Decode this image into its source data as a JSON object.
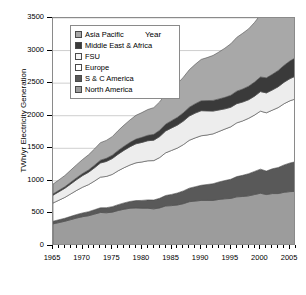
{
  "chart_data": {
    "type": "area",
    "title": "",
    "xlabel": "Year",
    "ylabel": "TWh/yr Electricity Generation",
    "stacked": true,
    "grid": "horizontal",
    "legend_position": "top-left-inside",
    "xlim": [
      1965,
      2006
    ],
    "ylim": [
      0,
      3500
    ],
    "ytick_step": 500,
    "ytick_labels": [
      "0",
      "500",
      "1000",
      "1500",
      "2000",
      "2500",
      "3000",
      "3500"
    ],
    "ytick_values": [
      0,
      500,
      1000,
      1500,
      2000,
      2500,
      3000,
      3500
    ],
    "xtick_labels": [
      "1965",
      "1970",
      "1975",
      "1980",
      "1985",
      "1990",
      "1995",
      "2000",
      "2005"
    ],
    "xtick_values": [
      1965,
      1970,
      1975,
      1980,
      1985,
      1990,
      1995,
      2000,
      2005
    ],
    "x": [
      1965,
      1966,
      1967,
      1968,
      1969,
      1970,
      1971,
      1972,
      1973,
      1974,
      1975,
      1976,
      1977,
      1978,
      1979,
      1980,
      1981,
      1982,
      1983,
      1984,
      1985,
      1986,
      1987,
      1988,
      1989,
      1990,
      1991,
      1992,
      1993,
      1994,
      1995,
      1996,
      1997,
      1998,
      1999,
      2000,
      2001,
      2002,
      2003,
      2004,
      2005,
      2006
    ],
    "series": [
      {
        "name": "North America",
        "color": "#9c9c9c",
        "stack_order": 1,
        "values": [
          340,
          360,
          380,
          405,
          430,
          450,
          465,
          490,
          515,
          510,
          520,
          545,
          565,
          580,
          585,
          580,
          580,
          570,
          585,
          615,
          620,
          630,
          650,
          680,
          690,
          700,
          700,
          700,
          715,
          725,
          730,
          755,
          760,
          770,
          790,
          810,
          790,
          805,
          805,
          825,
          835,
          840
        ]
      },
      {
        "name": "S & C America",
        "color": "#595959",
        "stack_order": 2,
        "values": [
          40,
          43,
          46,
          50,
          54,
          58,
          62,
          67,
          72,
          78,
          84,
          90,
          97,
          104,
          112,
          120,
          128,
          136,
          148,
          160,
          172,
          184,
          196,
          208,
          220,
          232,
          244,
          256,
          268,
          280,
          295,
          310,
          325,
          340,
          355,
          370,
          360,
          380,
          400,
          420,
          440,
          455
        ]
      },
      {
        "name": "Europe",
        "color": "#ffffff",
        "stack_order": 3,
        "values": [
          280,
          300,
          320,
          345,
          370,
          395,
          415,
          440,
          470,
          480,
          495,
          520,
          540,
          560,
          580,
          590,
          600,
          605,
          625,
          655,
          675,
          690,
          710,
          735,
          750,
          760,
          760,
          765,
          775,
          790,
          805,
          825,
          835,
          850,
          865,
          890,
          895,
          900,
          920,
          940,
          955,
          965
        ]
      },
      {
        "name": "FSU",
        "color": "#ededed",
        "stack_order": 4,
        "values": [
          120,
          130,
          140,
          152,
          165,
          178,
          190,
          203,
          217,
          230,
          243,
          255,
          268,
          280,
          292,
          300,
          308,
          313,
          322,
          335,
          345,
          352,
          362,
          372,
          380,
          385,
          370,
          350,
          330,
          310,
          300,
          295,
          290,
          285,
          290,
          300,
          305,
          310,
          320,
          330,
          340,
          350
        ]
      },
      {
        "name": "Middle East & Africa",
        "color": "#3a3a3a",
        "stack_order": 5,
        "values": [
          20,
          22,
          24,
          27,
          30,
          33,
          36,
          40,
          44,
          48,
          52,
          57,
          62,
          67,
          72,
          78,
          84,
          90,
          97,
          105,
          112,
          120,
          128,
          136,
          144,
          152,
          158,
          164,
          170,
          177,
          184,
          192,
          200,
          208,
          216,
          225,
          232,
          240,
          250,
          260,
          272,
          285
        ]
      },
      {
        "name": "Asia Pacific",
        "color": "#a8a8a8",
        "stack_order": 6,
        "values": [
          150,
          160,
          172,
          186,
          200,
          215,
          232,
          250,
          268,
          275,
          285,
          305,
          325,
          345,
          365,
          380,
          395,
          410,
          435,
          465,
          490,
          515,
          545,
          575,
          605,
          635,
          660,
          690,
          720,
          755,
          790,
          825,
          855,
          880,
          915,
          955,
          985,
          1035,
          1090,
          1150,
          1215,
          1280
        ]
      }
    ],
    "totals_note": "stacked totals rise from about 950 TWh/yr in 1965 to about 3000 TWh/yr in 2006"
  },
  "legend": {
    "items": [
      {
        "label": "Asia Pacific",
        "swatch": "#a8a8a8"
      },
      {
        "label": "Middle East & Africa",
        "swatch": "#3a3a3a"
      },
      {
        "label": "FSU",
        "swatch": "#f4f4f4"
      },
      {
        "label": "Europe",
        "swatch": "#ffffff"
      },
      {
        "label": "S & C America",
        "swatch": "#595959"
      },
      {
        "label": "North America",
        "swatch": "#9c9c9c"
      }
    ]
  }
}
